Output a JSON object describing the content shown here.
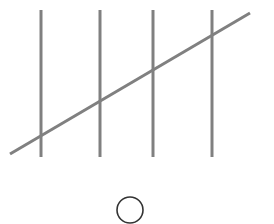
{
  "diagram": {
    "type": "tally-marks",
    "count": 5,
    "stroke_color": "#808080",
    "vertical_marks": [
      {
        "x": 41,
        "y1": 10,
        "y2": 157
      },
      {
        "x": 100,
        "y1": 10,
        "y2": 157
      },
      {
        "x": 153,
        "y1": 10,
        "y2": 157
      },
      {
        "x": 212,
        "y1": 10,
        "y2": 157
      }
    ],
    "diagonal_mark": {
      "x1": 10,
      "y1": 154,
      "x2": 250,
      "y2": 13
    },
    "answer_circle": {
      "cx": 130,
      "cy": 210,
      "r": 13,
      "stroke_color": "#333333"
    }
  }
}
